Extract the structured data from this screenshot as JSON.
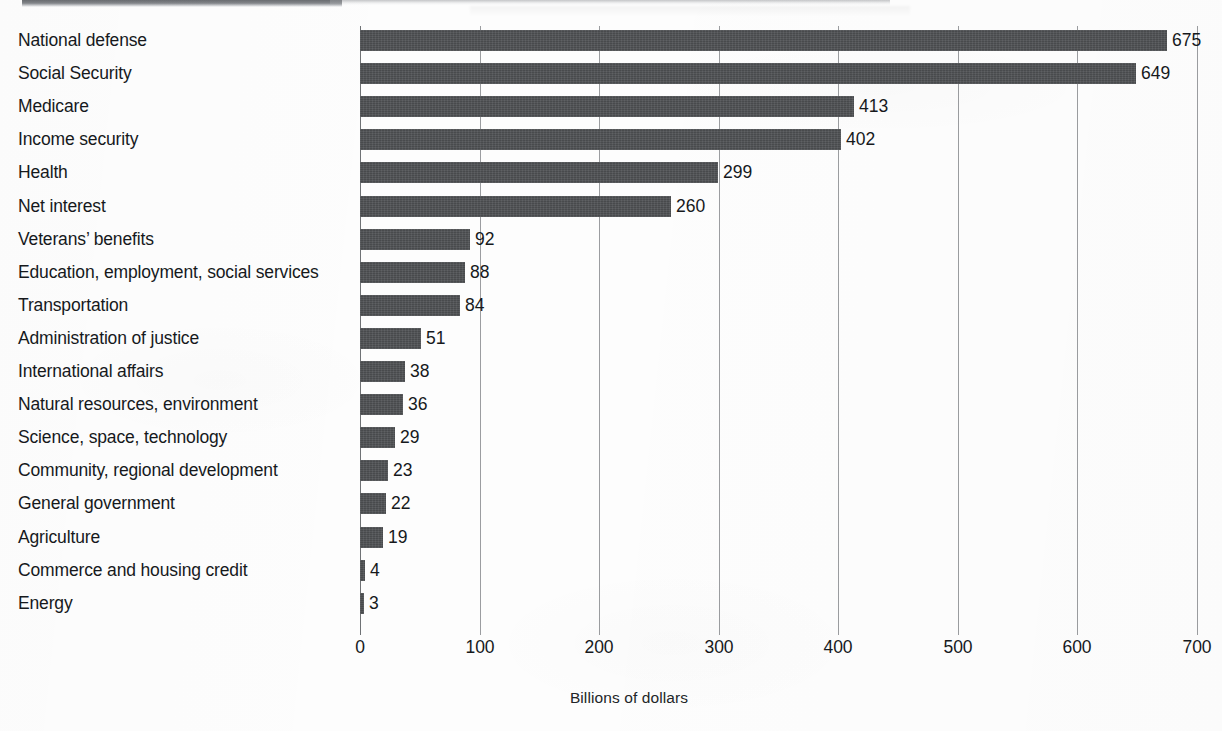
{
  "chart_data": {
    "type": "bar",
    "orientation": "horizontal",
    "title": "",
    "xlabel": "Billions of dollars",
    "ylabel": "",
    "xlim": [
      0,
      700
    ],
    "xticks": [
      0,
      100,
      200,
      300,
      400,
      500,
      600,
      700
    ],
    "xtick_labels": [
      "0",
      "100",
      "200",
      "300",
      "400",
      "500",
      "600",
      "700"
    ],
    "grid": "vertical",
    "legend": "none",
    "bar_color": "#4d4f52",
    "value_labels": true,
    "categories": [
      "National defense",
      "Social Security",
      "Medicare",
      "Income security",
      "Health",
      "Net interest",
      "Veterans’ benefits",
      "Education, employment, social services",
      "Transportation",
      "Administration of justice",
      "International affairs",
      "Natural resources, environment",
      "Science, space, technology",
      "Community, regional development",
      "General government",
      "Agriculture",
      "Commerce and housing credit",
      "Energy"
    ],
    "values": [
      675,
      649,
      413,
      402,
      299,
      260,
      92,
      88,
      84,
      51,
      38,
      36,
      29,
      23,
      22,
      19,
      4,
      3
    ],
    "value_label_text": [
      "675",
      "649",
      "413",
      "402",
      "299",
      "260",
      "92",
      "88",
      "84",
      "51",
      "38",
      "36",
      "29",
      "23",
      "22",
      "19",
      "4",
      "3"
    ]
  },
  "axis": {
    "x_title": "Billions of dollars"
  }
}
